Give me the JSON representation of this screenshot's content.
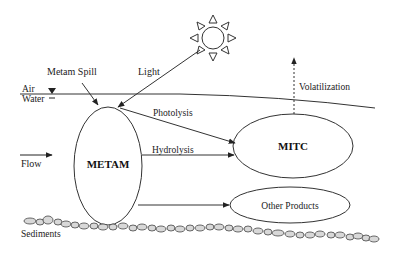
{
  "diagram": {
    "type": "environmental-fate-process-diagram",
    "nodes": {
      "metam": {
        "label": "METAM"
      },
      "mitc": {
        "label": "MITC"
      },
      "other_products": {
        "label": "Other Products"
      }
    },
    "labels": {
      "metam_spill": "Metam Spill",
      "light": "Light",
      "air": "Air",
      "water": "Water",
      "photolysis": "Photolysis",
      "hydrolysis": "Hydrolysis",
      "volatilization": "Volatilization",
      "flow": "Flow",
      "sediments": "Sediments"
    },
    "edges": [
      {
        "from": "Metam Spill",
        "to": "METAM"
      },
      {
        "from": "Sun (Light)",
        "to": "METAM"
      },
      {
        "from": "METAM",
        "to": "MITC",
        "label": "Photolysis"
      },
      {
        "from": "METAM",
        "to": "MITC",
        "label": "Hydrolysis"
      },
      {
        "from": "METAM",
        "to": "Other Products"
      },
      {
        "from": "MITC",
        "to": "Air",
        "label": "Volatilization",
        "style": "dashed"
      }
    ],
    "colors": {
      "stroke": "#333333",
      "background": "#ffffff"
    }
  }
}
